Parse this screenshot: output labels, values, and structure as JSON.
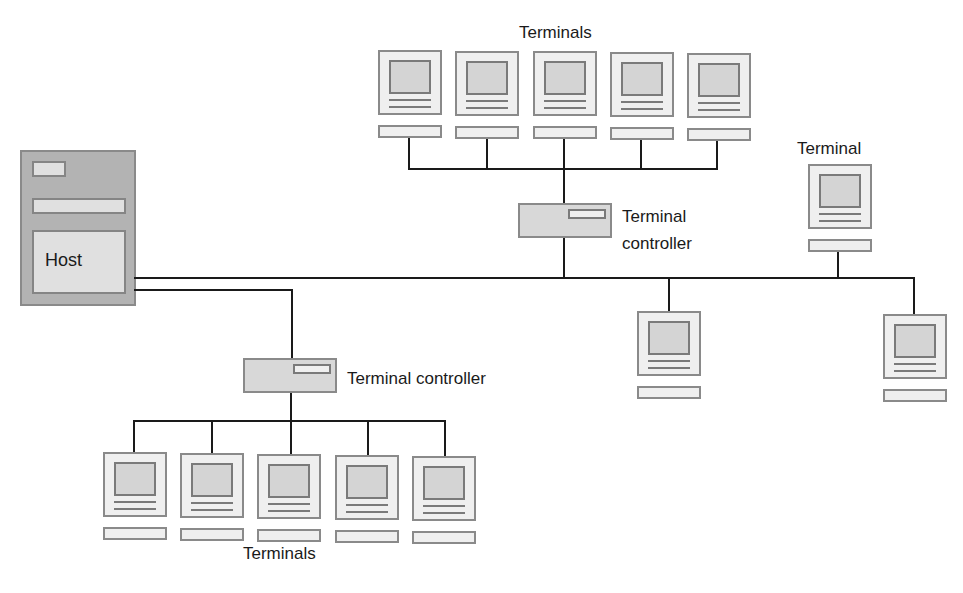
{
  "diagram": {
    "host": {
      "label": "Host"
    },
    "top_group": {
      "label": "Terminals",
      "controller_label_line1": "Terminal",
      "controller_label_line2": "controller",
      "terminal_count": 5
    },
    "standalone_terminal": {
      "label": "Terminal"
    },
    "bottom_group": {
      "label": "Terminals",
      "controller_label": "Terminal controller",
      "terminal_count": 5
    },
    "bus_terminals_unlabeled_count": 2,
    "colors": {
      "line": "#1a1a1a",
      "host_fill": "#b3b3b3",
      "device_fill": "#efefef",
      "screen_fill": "#d4d4d4",
      "controller_fill": "#d8d8d8",
      "outline": "#8a8a8a"
    }
  }
}
